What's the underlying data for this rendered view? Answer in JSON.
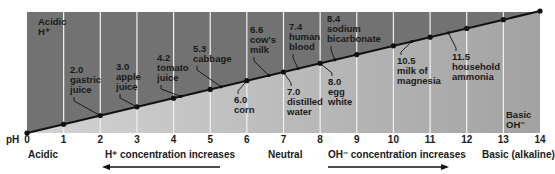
{
  "diagram": {
    "axis_label": "pH",
    "ticks": [
      "0",
      "1",
      "2",
      "3",
      "4",
      "5",
      "6",
      "7",
      "8",
      "9",
      "10",
      "11",
      "12",
      "13",
      "14"
    ],
    "corner_labels": {
      "acidic": [
        "Acidic",
        "H⁺"
      ],
      "basic": [
        "Basic",
        "OH⁻"
      ]
    },
    "footer": {
      "acidic": "Acidic",
      "neutral": "Neutral",
      "basic": "Basic (alkaline)",
      "h_increase": "H⁺ concentration increases",
      "oh_increase": "OH⁻  concentration increases"
    },
    "colors": {
      "upper": "#727272",
      "lower_left": "#d4d4d4",
      "lower_right": "#a2a2a2",
      "gridline": "#f2f2f2",
      "line": "#111111"
    },
    "substances": [
      {
        "ph": 2.0,
        "value": "2.0",
        "lines": [
          "gastric",
          "juice"
        ],
        "side": "above"
      },
      {
        "ph": 3.0,
        "value": "3.0",
        "lines": [
          "apple",
          "juice"
        ],
        "side": "above"
      },
      {
        "ph": 4.2,
        "value": "4.2",
        "lines": [
          "tomato",
          "juice"
        ],
        "side": "above"
      },
      {
        "ph": 5.3,
        "value": "5.3",
        "lines": [
          "cabbage"
        ],
        "side": "above"
      },
      {
        "ph": 6.0,
        "value": "6.0",
        "lines": [
          "corn"
        ],
        "side": "below"
      },
      {
        "ph": 6.6,
        "value": "6.6",
        "lines": [
          "cow's",
          "milk"
        ],
        "side": "above"
      },
      {
        "ph": 7.0,
        "value": "7.0",
        "lines": [
          "distilled",
          "water"
        ],
        "side": "below"
      },
      {
        "ph": 7.4,
        "value": "7.4",
        "lines": [
          "human",
          "blood"
        ],
        "side": "above"
      },
      {
        "ph": 8.0,
        "value": "8.0",
        "lines": [
          "egg",
          "white"
        ],
        "side": "below"
      },
      {
        "ph": 8.4,
        "value": "8.4",
        "lines": [
          "sodium",
          "bicarbonate"
        ],
        "side": "above"
      },
      {
        "ph": 10.5,
        "value": "10.5",
        "lines": [
          "milk of",
          "magnesia"
        ],
        "side": "below"
      },
      {
        "ph": 11.5,
        "value": "11.5",
        "lines": [
          "household",
          "ammonia"
        ],
        "side": "below"
      }
    ]
  }
}
